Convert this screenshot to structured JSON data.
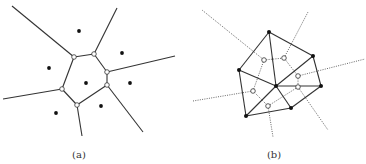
{
  "panels": [
    {
      "id": "a",
      "label": "(a)",
      "label_pos": [
        79,
        149
      ],
      "title": "Voronoi diagram",
      "sites": [
        [
          79,
          31
        ],
        [
          122,
          53
        ],
        [
          49,
          68
        ],
        [
          86,
          83
        ],
        [
          130,
          83
        ],
        [
          101,
          106
        ],
        [
          56,
          113
        ]
      ],
      "vertices": [
        [
          74,
          57
        ],
        [
          94,
          54
        ],
        [
          107,
          72
        ],
        [
          107,
          85
        ],
        [
          77,
          105
        ],
        [
          62,
          89
        ]
      ],
      "cell_edges": [
        [
          0,
          1
        ],
        [
          1,
          2
        ],
        [
          2,
          3
        ],
        [
          3,
          4
        ],
        [
          4,
          5
        ],
        [
          5,
          0
        ]
      ],
      "rays": [
        {
          "from": 0,
          "to": [
            12,
            6
          ]
        },
        {
          "from": 1,
          "to": [
            117,
            8
          ]
        },
        {
          "from": 2,
          "to": [
            175,
            56
          ]
        },
        {
          "from": 3,
          "to": [
            143,
            132
          ]
        },
        {
          "from": 4,
          "to": [
            82,
            136
          ]
        },
        {
          "from": 5,
          "to": [
            3,
            99
          ]
        }
      ]
    },
    {
      "id": "b",
      "label": "(b)",
      "label_pos": [
        274,
        149
      ],
      "title": "Delaunay triangulation with dual Voronoi diagram",
      "sites": [
        [
          269,
          32
        ],
        [
          313,
          56
        ],
        [
          239,
          70
        ],
        [
          276,
          86
        ],
        [
          321,
          86
        ],
        [
          291,
          108
        ],
        [
          246,
          116
        ]
      ],
      "triangulation_edges": [
        [
          0,
          1
        ],
        [
          1,
          4
        ],
        [
          4,
          5
        ],
        [
          5,
          6
        ],
        [
          6,
          2
        ],
        [
          2,
          0
        ],
        [
          0,
          3
        ],
        [
          2,
          3
        ],
        [
          1,
          3
        ],
        [
          4,
          3
        ],
        [
          5,
          3
        ],
        [
          6,
          3
        ]
      ],
      "voronoi_vertices": [
        [
          264,
          60
        ],
        [
          284,
          58
        ],
        [
          298,
          76
        ],
        [
          298,
          87
        ],
        [
          268,
          106
        ],
        [
          253,
          91
        ]
      ],
      "voronoi_edges": [
        [
          0,
          1
        ],
        [
          1,
          2
        ],
        [
          2,
          3
        ],
        [
          3,
          4
        ],
        [
          4,
          5
        ],
        [
          5,
          0
        ]
      ],
      "voronoi_rays": [
        {
          "from": 0,
          "to": [
            202,
            10
          ]
        },
        {
          "from": 1,
          "to": [
            308,
            12
          ]
        },
        {
          "from": 2,
          "to": [
            365,
            59
          ]
        },
        {
          "from": 3,
          "to": [
            328,
            130
          ]
        },
        {
          "from": 4,
          "to": [
            273,
            137
          ]
        },
        {
          "from": 5,
          "to": [
            193,
            101
          ]
        }
      ]
    }
  ],
  "colors": {
    "line": "#333333",
    "site": "#111111",
    "vertex_fill": "#ffffff",
    "dotted": "#555555"
  }
}
